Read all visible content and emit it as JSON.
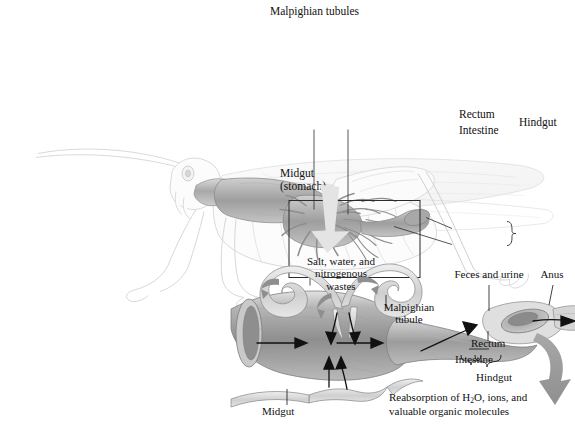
{
  "figure": {
    "domain": "Diagram",
    "background_color": "#ffffff",
    "line_color": "#4a4a4a",
    "tissue_color": "#9a9a9a",
    "arrow_color": "#8c8c8c"
  },
  "top_panel": {
    "name": "whole-grasshopper-overview",
    "labels": {
      "malpighian_tubules": "Malpighian tubules",
      "rectum": "Rectum",
      "intestine": "Intestine",
      "hindgut": "Hindgut",
      "midgut_line1": "Midgut",
      "midgut_line2": "(stomach)"
    },
    "detail_box": {
      "x": 289,
      "y": 87,
      "width": 131,
      "height": 77
    }
  },
  "connector": {
    "name": "zoom-connector-arrow",
    "direction": "down-right",
    "color": "#e2e2e2"
  },
  "bottom_panel": {
    "name": "gut-detail-closeup",
    "labels": {
      "salt_water_line1": "Salt, water, and",
      "salt_water_line2": "nitrogenous",
      "salt_water_line3": "wastes",
      "feces_and_urine": "Feces and urine",
      "anus": "Anus",
      "malpighian_line1": "Malpighian",
      "malpighian_line2": "tubule",
      "rectum": "Rectum",
      "intestine": "Intestine",
      "hindgut": "Hindgut",
      "midgut": "Midgut",
      "reabsorption_line1_a": "Reabsorption of H",
      "reabsorption_line1_sub": "2",
      "reabsorption_line1_b": "O, ions, and",
      "reabsorption_line2": "valuable organic molecules"
    }
  }
}
